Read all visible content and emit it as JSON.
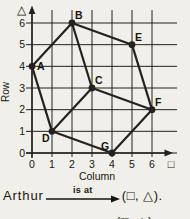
{
  "colors": {
    "background": "#f1efe9",
    "ink": "#17150f",
    "line": "#242220"
  },
  "chart_data": {
    "type": "scatter",
    "title": "",
    "xlabel": "Column",
    "ylabel": "Row",
    "x_unit_symbol": "□",
    "y_unit_symbol": "△",
    "xlim": [
      0,
      6
    ],
    "ylim": [
      0,
      6
    ],
    "x_ticks": [
      "0",
      "1",
      "2",
      "3",
      "4",
      "5",
      "6"
    ],
    "y_ticks": [
      "0",
      "1",
      "2",
      "3",
      "4",
      "5",
      "6"
    ],
    "grid": true,
    "points": [
      {
        "label": "A",
        "x": 0,
        "y": 4,
        "label_pos": "right"
      },
      {
        "label": "B",
        "x": 2,
        "y": 6,
        "label_pos": "above-right"
      },
      {
        "label": "C",
        "x": 3,
        "y": 3,
        "label_pos": "above-right"
      },
      {
        "label": "D",
        "x": 1,
        "y": 1,
        "label_pos": "below-left"
      },
      {
        "label": "E",
        "x": 5,
        "y": 5,
        "label_pos": "above-right"
      },
      {
        "label": "F",
        "x": 6,
        "y": 2,
        "label_pos": "above-right"
      },
      {
        "label": "G",
        "x": 4,
        "y": 0,
        "label_pos": "above-left"
      }
    ],
    "edges": [
      [
        "A",
        "B"
      ],
      [
        "A",
        "D"
      ],
      [
        "B",
        "C"
      ],
      [
        "B",
        "E"
      ],
      [
        "C",
        "D"
      ],
      [
        "C",
        "F"
      ],
      [
        "D",
        "G"
      ],
      [
        "E",
        "F"
      ],
      [
        "F",
        "G"
      ]
    ]
  },
  "caption": {
    "subject": "Arthur",
    "relation": "is at",
    "object": "(□, △).",
    "partial_next_line": "(□, △)."
  }
}
